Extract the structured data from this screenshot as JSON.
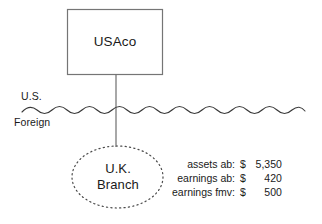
{
  "diagram": {
    "parent_entity": {
      "name": "USAco",
      "shape": "rectangle"
    },
    "branch_entity": {
      "name_line1": "U.K.",
      "name_line2": "Branch",
      "shape": "dotted-ellipse"
    },
    "border": {
      "above_label": "U.S.",
      "below_label": "Foreign",
      "style": "wavy-line"
    },
    "figures": [
      {
        "label": "assets ab:",
        "currency": "$",
        "amount": "5,350"
      },
      {
        "label": "earnings ab:",
        "currency": "$",
        "amount": "420"
      },
      {
        "label": "earnings fmv:",
        "currency": "$",
        "amount": "500"
      }
    ],
    "colors": {
      "stroke": "#6b6b6b",
      "text": "#1a1a1a",
      "background": "#ffffff"
    }
  }
}
